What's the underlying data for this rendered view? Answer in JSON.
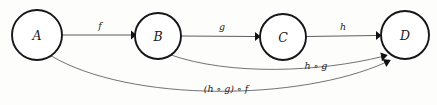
{
  "diagram": {
    "type": "commutative-diagram",
    "background_color": "#fdfdfc",
    "node_stroke_color": "#16161a",
    "edge_color": "#5d5d63",
    "label_color": "#1d1d21",
    "nodes": [
      {
        "id": "A",
        "label": "A",
        "cx": 37,
        "cy": 35,
        "r": 25
      },
      {
        "id": "B",
        "label": "B",
        "cx": 158,
        "cy": 36,
        "r": 23
      },
      {
        "id": "C",
        "label": "C",
        "cx": 283,
        "cy": 37,
        "r": 23
      },
      {
        "id": "D",
        "label": "D",
        "cx": 405,
        "cy": 35,
        "r": 24
      }
    ],
    "edges": [
      {
        "id": "f",
        "label": "f",
        "from": "A",
        "to": "B",
        "shape": "straight",
        "label_x": 100,
        "label_y": 26
      },
      {
        "id": "g",
        "label": "g",
        "from": "B",
        "to": "C",
        "shape": "straight",
        "label_x": 222,
        "label_y": 27
      },
      {
        "id": "h",
        "label": "h",
        "from": "C",
        "to": "D",
        "shape": "straight",
        "label_x": 343,
        "label_y": 27
      },
      {
        "id": "hg",
        "label": "h ∘ g",
        "from": "B",
        "to": "D",
        "shape": "curve",
        "label_x": 316,
        "label_y": 66
      },
      {
        "id": "hgf",
        "label": "(h ∘ g) ∘ f",
        "from": "A",
        "to": "D",
        "shape": "curve",
        "label_x": 226,
        "label_y": 89
      }
    ]
  }
}
